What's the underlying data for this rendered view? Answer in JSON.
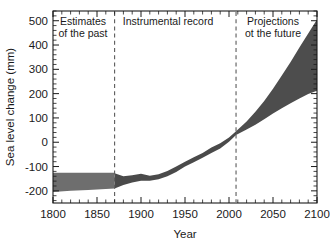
{
  "chart_data": {
    "type": "area",
    "title": "",
    "xlabel": "Year",
    "ylabel": "Sea level change (mm)",
    "xlim": [
      1800,
      2100
    ],
    "ylim": [
      -250,
      540
    ],
    "xticks": [
      1800,
      1850,
      1900,
      1950,
      2000,
      2050,
      2100
    ],
    "xtick_labels": [
      "1800",
      "1850",
      "1900",
      "1950",
      "2000",
      "2050",
      "2100"
    ],
    "x_minor_tick_step": 10,
    "yticks": [
      -200,
      -100,
      0,
      100,
      200,
      300,
      400,
      500
    ],
    "ytick_labels": [
      "-200",
      "-100",
      "0",
      "100",
      "200",
      "300",
      "400",
      "500"
    ],
    "y_minor_tick_step": 20,
    "grid": false,
    "legend": "none",
    "band_color": "#6e6e6e",
    "projection_color": "#4d4d4d",
    "divider_color": "#5b5b5b",
    "region_dividers": [
      1870,
      2008
    ],
    "regions": [
      {
        "name": "past",
        "label_line1": "Estimates",
        "label_line2": "of the past",
        "x_start": 1800,
        "x_end": 1870
      },
      {
        "name": "instrumental",
        "label_line1": "Instrumental record",
        "label_line2": "",
        "x_start": 1870,
        "x_end": 2008
      },
      {
        "name": "projections",
        "label_line1": "Projections",
        "label_line2": "ot the future",
        "x_start": 2008,
        "x_end": 2100
      }
    ],
    "series": [
      {
        "name": "Estimates of the past (uncertainty band)",
        "x": [
          1800,
          1820,
          1840,
          1860,
          1870
        ],
        "upper": [
          -126,
          -126,
          -126,
          -126,
          -126
        ],
        "lower": [
          -205,
          -200,
          -196,
          -192,
          -190
        ]
      },
      {
        "name": "Instrumental record (uncertainty band)",
        "x": [
          1870,
          1880,
          1890,
          1900,
          1910,
          1920,
          1930,
          1940,
          1950,
          1960,
          1970,
          1980,
          1990,
          2000,
          2008
        ],
        "upper": [
          -128,
          -140,
          -136,
          -130,
          -138,
          -132,
          -118,
          -100,
          -80,
          -62,
          -44,
          -22,
          -4,
          20,
          45
        ],
        "lower": [
          -190,
          -176,
          -166,
          -158,
          -158,
          -152,
          -140,
          -122,
          -100,
          -82,
          -64,
          -44,
          -26,
          2,
          30
        ]
      },
      {
        "name": "Projections of the future (range)",
        "x": [
          2008,
          2020,
          2030,
          2040,
          2050,
          2060,
          2070,
          2080,
          2090,
          2100
        ],
        "upper": [
          45,
          85,
          125,
          170,
          220,
          275,
          330,
          390,
          447,
          505
        ],
        "lower": [
          30,
          52,
          72,
          95,
          118,
          140,
          160,
          180,
          198,
          212
        ]
      }
    ]
  }
}
